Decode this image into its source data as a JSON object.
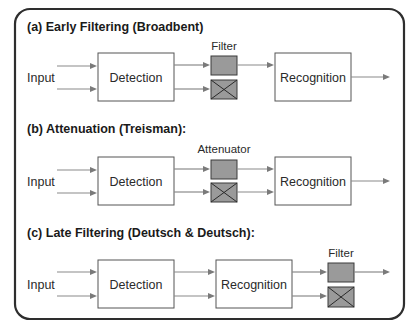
{
  "figure": {
    "panels": [
      {
        "id": "a",
        "title": "(a)  Early Filtering (Broadbent)",
        "input_label": "Input",
        "stages": [
          "Detection",
          "Recognition"
        ],
        "gate_label": "Filter",
        "gate_position": "between-detection-and-recognition",
        "gate_states": [
          "pass",
          "blocked"
        ],
        "passes_blocked_channel": false
      },
      {
        "id": "b",
        "title": "(b)  Attenuation (Treisman):",
        "input_label": "Input",
        "stages": [
          "Detection",
          "Recognition"
        ],
        "gate_label": "Attenuator",
        "gate_position": "between-detection-and-recognition",
        "gate_states": [
          "pass",
          "attenuated"
        ],
        "passes_blocked_channel": true
      },
      {
        "id": "c",
        "title": "(c)  Late Filtering (Deutsch & Deutsch):",
        "input_label": "Input",
        "stages": [
          "Detection",
          "Recognition"
        ],
        "gate_label": "Filter",
        "gate_position": "after-recognition",
        "gate_states": [
          "pass",
          "blocked"
        ],
        "passes_blocked_channel": false
      }
    ],
    "colors": {
      "border": "#2e2e2e",
      "gate_fill": "#9a9a9a",
      "arrow": "#8a8a8a"
    }
  }
}
